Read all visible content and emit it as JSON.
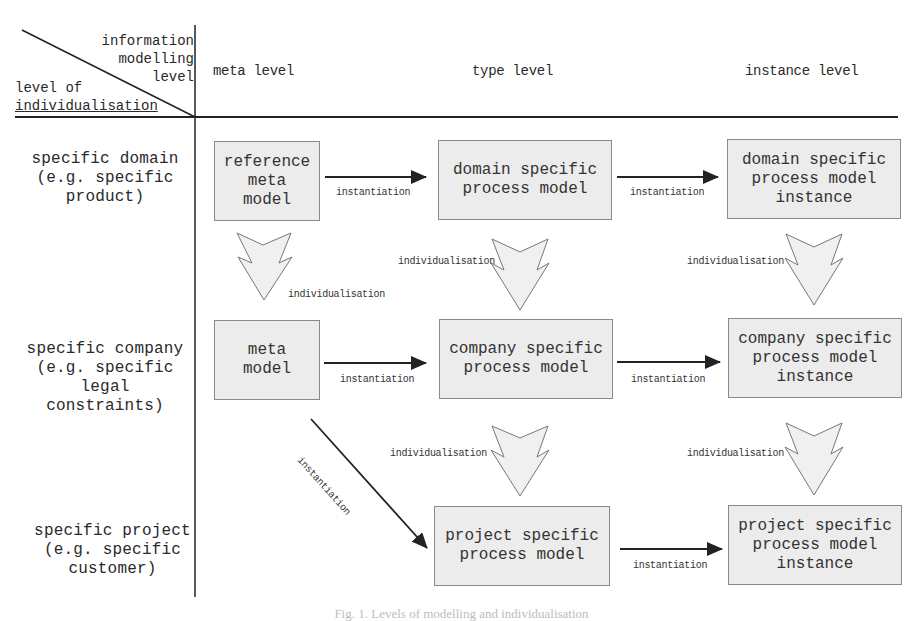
{
  "header": {
    "corner_top": [
      "information",
      "modelling",
      "level"
    ],
    "corner_bottom": [
      "level of",
      "individualisation"
    ],
    "columns": [
      "meta level",
      "type level",
      "instance level"
    ]
  },
  "rows": [
    {
      "label": [
        "specific domain",
        "(e.g. specific",
        "product)"
      ]
    },
    {
      "label": [
        "specific company",
        "(e.g. specific legal",
        "constraints)"
      ]
    },
    {
      "label": [
        "specific project",
        "(e.g. specific",
        "customer)"
      ]
    }
  ],
  "boxes": {
    "reference_meta_model": [
      "reference",
      "meta",
      "model"
    ],
    "domain_type": [
      "domain specific",
      "process model"
    ],
    "domain_instance": [
      "domain specific",
      "process model",
      "instance"
    ],
    "meta_model": [
      "meta",
      "model"
    ],
    "company_type": [
      "company specific",
      "process model"
    ],
    "company_instance": [
      "company specific",
      "process model",
      "instance"
    ],
    "project_type": [
      "project specific",
      "process model"
    ],
    "project_instance": [
      "project specific",
      "process model",
      "instance"
    ]
  },
  "edge_labels": {
    "instantiation": "instantiation",
    "individualisation": "individualisation"
  },
  "caption": "Fig. 1. Levels of modelling and individualisation",
  "colors": {
    "box_fill": "#ececec",
    "box_border": "#8a8a8a",
    "arrow_fill": "#f0f0f0",
    "line": "#222222"
  }
}
